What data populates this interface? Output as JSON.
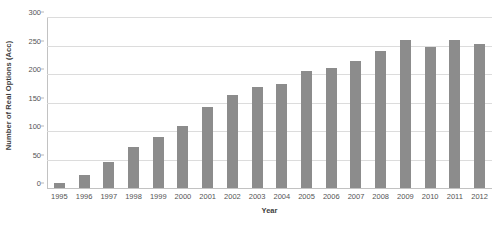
{
  "chart_data": {
    "type": "bar",
    "title": "",
    "xlabel": "Year",
    "ylabel": "Number of Real Options (Acc)",
    "categories": [
      "1995",
      "1996",
      "1997",
      "1998",
      "1999",
      "2000",
      "2001",
      "2002",
      "2003",
      "2004",
      "2005",
      "2006",
      "2007",
      "2008",
      "2009",
      "2010",
      "2011",
      "2012"
    ],
    "values": [
      9,
      23,
      45,
      72,
      90,
      108,
      142,
      163,
      178,
      182,
      205,
      211,
      222,
      240,
      259,
      248,
      259,
      252
    ],
    "series": [
      {
        "name": "Number of Real Options (Acc)",
        "values": [
          9,
          23,
          45,
          72,
          90,
          108,
          142,
          163,
          178,
          182,
          205,
          211,
          222,
          240,
          259,
          248,
          259,
          252
        ]
      }
    ],
    "ylim": [
      0,
      300
    ],
    "yticks": [
      0,
      50,
      100,
      150,
      200,
      250,
      300
    ],
    "ytick_labels": [
      "0",
      "50",
      "100",
      "150",
      "200",
      "250",
      "300"
    ],
    "xlim_categories": 18,
    "grid": "horizontal",
    "legend": "none",
    "bar_color": "#8c8c8c",
    "gridline_color": "#dcdcdc",
    "axis_color": "#c2c2c2",
    "background": "#ffffff"
  }
}
